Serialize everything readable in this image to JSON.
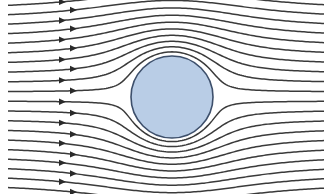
{
  "diagram": {
    "title": "Streamlines of flow around a cylinder",
    "width": 331,
    "height": 194,
    "background": "#ffffff",
    "streamlines": {
      "count": 20,
      "color": "#3a3a3a",
      "stroke_width": 1.5,
      "x_start": 8,
      "x_end": 325,
      "y_start": 10,
      "spacing": 9.1,
      "arrow_x_positions": [
        62,
        73
      ],
      "arrow_color": "#2a2a2a"
    },
    "cylinder": {
      "cx": 172,
      "cy": 97,
      "r": 41,
      "fill": "#b9cde6",
      "stroke": "#3d4f6b",
      "stroke_width": 1.6
    },
    "flow_direction": "left-to-right"
  }
}
